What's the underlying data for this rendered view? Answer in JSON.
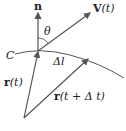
{
  "diagram": {
    "labels": {
      "normal": "n",
      "velocity_bold": "V",
      "velocity_arg": "(t)",
      "angle": "θ",
      "curve": "C",
      "arc_length": "Δl",
      "position_bold": "r",
      "position_arg": "(t)",
      "position2_bold": "r",
      "position2_arg": "(t + Δ t)"
    },
    "colors": {
      "stroke": "#555555",
      "text": "#222222"
    }
  }
}
